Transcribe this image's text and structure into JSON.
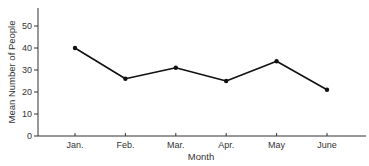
{
  "chart_data": {
    "type": "line",
    "title": "",
    "xlabel": "Month",
    "ylabel": "Mean Number of People",
    "categories": [
      "Jan.",
      "Feb.",
      "Mar.",
      "Apr.",
      "May",
      "June"
    ],
    "series": [
      {
        "name": "Mean Number of People",
        "values": [
          40,
          26,
          31,
          25,
          34,
          21
        ]
      }
    ],
    "yticks": [
      0,
      10,
      20,
      30,
      40,
      50
    ],
    "ylim": [
      0,
      58
    ],
    "grid": false,
    "legend": null,
    "colors": {
      "line": "#111111",
      "axis": "#333333"
    }
  }
}
